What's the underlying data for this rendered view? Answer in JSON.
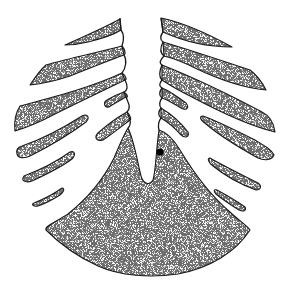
{
  "figure": {
    "colors": {
      "background": "#ffffff",
      "stipple": "#2a2a2a",
      "outline": "#1a1a1a",
      "dot": "#000000"
    },
    "labels": []
  }
}
